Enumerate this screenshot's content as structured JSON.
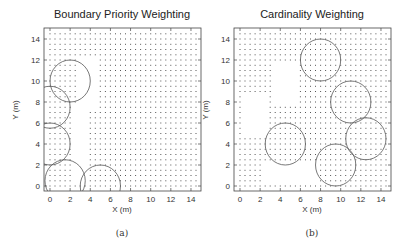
{
  "chart_data": [
    {
      "id": "a",
      "type": "scatter",
      "title": "Boundary Priority Weighting",
      "xlabel": "X (m)",
      "ylabel": "Y (m)",
      "caption": "(a)",
      "xticks": [
        0,
        2,
        4,
        6,
        8,
        10,
        12,
        14
      ],
      "yticks": [
        0,
        2,
        4,
        6,
        8,
        10,
        12,
        14
      ],
      "xlim": [
        -0.6,
        15
      ],
      "ylim": [
        -0.5,
        15
      ],
      "grid": false,
      "dot_grid": {
        "spacing": 0.5,
        "range": [
          0,
          14.5
        ],
        "description": "uniform sample point grid with sparse/empty region near left boundary"
      },
      "empty_regions": [
        {
          "x": [
            2.8,
            4.5
          ],
          "y": [
            7.5,
            12
          ]
        },
        {
          "x": [
            2.5,
            3.5
          ],
          "y": [
            0.5,
            7.5
          ]
        }
      ],
      "circles": [
        {
          "cx": 2.0,
          "cy": 10.0,
          "r": 2.0
        },
        {
          "cx": 0.0,
          "cy": 7.5,
          "r": 2.0
        },
        {
          "cx": 0.0,
          "cy": 4.0,
          "r": 2.0
        },
        {
          "cx": 1.5,
          "cy": 0.5,
          "r": 2.0
        },
        {
          "cx": 5.0,
          "cy": 0.0,
          "r": 2.0
        }
      ]
    },
    {
      "id": "b",
      "type": "scatter",
      "title": "Cardinality Weighting",
      "xlabel": "X (m)",
      "ylabel": "Y (m)",
      "caption": "(b)",
      "xticks": [
        0,
        2,
        4,
        6,
        8,
        10,
        12,
        14
      ],
      "yticks": [
        0,
        2,
        4,
        6,
        8,
        10,
        12,
        14
      ],
      "xlim": [
        -0.6,
        15
      ],
      "ylim": [
        -0.5,
        15
      ],
      "grid": false,
      "dot_grid": {
        "spacing": 0.5,
        "range": [
          0,
          14.5
        ],
        "description": "uniform sample point grid with empty regions on left side"
      },
      "empty_regions": [
        {
          "x": [
            3.5,
            5.5
          ],
          "y": [
            8,
            11.5
          ]
        },
        {
          "x": [
            0.5,
            2.5
          ],
          "y": [
            5,
            8.5
          ]
        },
        {
          "x": [
            2.5,
            7.5
          ],
          "y": [
            0.5,
            2
          ]
        }
      ],
      "circles": [
        {
          "cx": 8.0,
          "cy": 12.0,
          "r": 2.0
        },
        {
          "cx": 11.0,
          "cy": 8.0,
          "r": 2.0
        },
        {
          "cx": 12.5,
          "cy": 4.5,
          "r": 2.0
        },
        {
          "cx": 9.5,
          "cy": 2.0,
          "r": 2.0
        },
        {
          "cx": 4.5,
          "cy": 4.0,
          "r": 2.0
        }
      ]
    }
  ],
  "colors": {
    "axis": "#444444",
    "dots": "#555555",
    "circles": "#555555",
    "text": "#333333"
  }
}
